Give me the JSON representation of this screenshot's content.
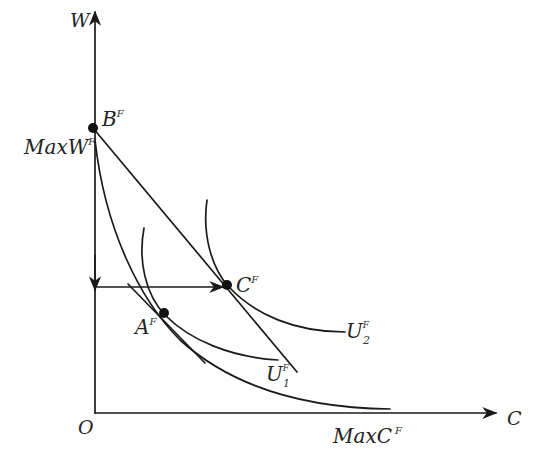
{
  "diagram": {
    "type": "economics indifference-curve / frontier diagram",
    "axes": {
      "y_label": "W",
      "x_label": "C",
      "origin_label": "O"
    },
    "labels": {
      "max_w": {
        "base": "MaxW",
        "sup": "F"
      },
      "max_c": {
        "base": "MaxC",
        "sup": "F"
      },
      "point_b": {
        "base": "B",
        "sup": "F"
      },
      "point_c": {
        "base": "C",
        "sup": "F"
      },
      "point_a": {
        "base": "A",
        "sup": "F"
      },
      "u1": {
        "base": "U",
        "sup": "F",
        "sub": "1"
      },
      "u2": {
        "base": "U",
        "sup": "F",
        "sub": "2"
      }
    },
    "points": [
      {
        "name": "B^F",
        "x": 93,
        "y": 128
      },
      {
        "name": "C^F",
        "x": 227,
        "y": 285
      },
      {
        "name": "A^F",
        "x": 164,
        "y": 313
      }
    ],
    "colors": {
      "ink": "#1a1a1a",
      "background": "#ffffff"
    }
  },
  "caption": {
    "text": "",
    "note": "caption cut off at bottom edge, illegible"
  }
}
